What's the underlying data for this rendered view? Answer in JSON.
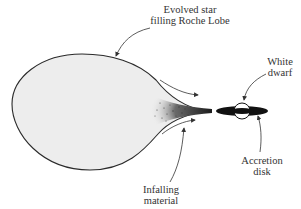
{
  "diagram": {
    "labels": {
      "evolved_star_line1": "Evolved star",
      "evolved_star_line2": "filling Roche Lobe",
      "white_dwarf_line1": "White",
      "white_dwarf_line2": "dwarf",
      "accretion_disk_line1": "Accretion",
      "accretion_disk_line2": "disk",
      "infalling_line1": "Infalling",
      "infalling_line2": "material"
    },
    "colors": {
      "star_fill": "#ededed",
      "outline": "#2a2a2a",
      "disk": "#111111",
      "stream": "#3a3a3a"
    }
  }
}
